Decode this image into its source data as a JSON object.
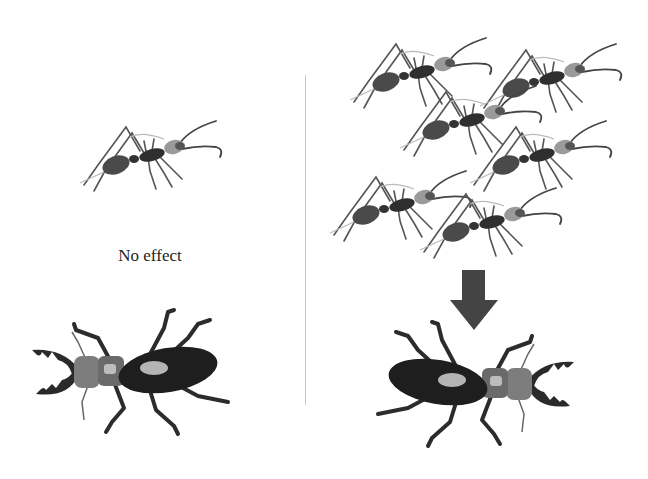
{
  "figure": {
    "left_panel": {
      "caption": "No effect",
      "ant_count": 1,
      "beetle_orientation": "facing-left"
    },
    "right_panel": {
      "ant_count": 6,
      "arrow": "down",
      "beetle_orientation": "facing-right"
    },
    "colors": {
      "ink": "#2a2a2a",
      "body": "#3a3a3a",
      "arrow": "#444444",
      "divider": "#c9c9c9",
      "background": "#ffffff"
    }
  }
}
